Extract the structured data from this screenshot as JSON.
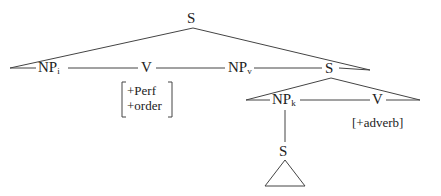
{
  "tree": {
    "root": {
      "label": "S"
    },
    "row1": [
      {
        "label": "NP",
        "sub": "i"
      },
      {
        "label": "V",
        "features": [
          "+Perf",
          "+order"
        ]
      },
      {
        "label": "NP",
        "sub": "v"
      },
      {
        "label": "S"
      }
    ],
    "row2": [
      {
        "label": "NP",
        "sub": "k"
      },
      {
        "label": "V",
        "features": [
          "[+adverb]"
        ]
      }
    ],
    "row3": [
      {
        "label": "S",
        "child": "triangle"
      }
    ]
  }
}
